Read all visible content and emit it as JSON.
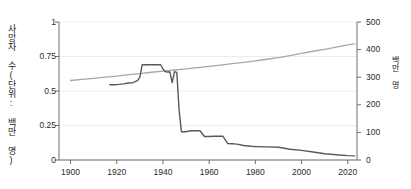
{
  "chart_data": {
    "type": "line",
    "title": "",
    "subtitle": "",
    "xlabel": "",
    "ylabel": "사망자 수(단위: 백만 명)",
    "ylabel_right": "백만 명",
    "xlim": [
      1895,
      2024
    ],
    "ylim": [
      0,
      1
    ],
    "ylim_right": [
      0,
      500
    ],
    "grid": true,
    "legend_position": "none",
    "xticks": [
      1900,
      1920,
      1940,
      1960,
      1980,
      2000,
      2020
    ],
    "xtick_labels": [
      "1900",
      "1920",
      "1940",
      "1960",
      "1980",
      "2000",
      "2020"
    ],
    "yticks_left": [
      0,
      0.25,
      0.5,
      0.75,
      1
    ],
    "ytick_labels_left": [
      "0",
      "0.25",
      "0.5",
      "0.75",
      "1"
    ],
    "yticks_right": [
      0,
      100,
      200,
      300,
      400,
      500
    ],
    "ytick_labels_right": [
      "0",
      "100",
      "200",
      "300",
      "400",
      "500"
    ],
    "colors": {
      "population_line": "#a7a7a7",
      "deaths_line": "#5a5a5a",
      "grid": "#ececec",
      "axis": "#6e6e6e",
      "background": "#ffffff"
    },
    "series": [
      {
        "name": "인구",
        "axis": "right",
        "color": "#a7a7a7",
        "x": [
          1900,
          1905,
          1910,
          1915,
          1920,
          1925,
          1930,
          1935,
          1940,
          1945,
          1950,
          1955,
          1960,
          1965,
          1970,
          1975,
          1980,
          1985,
          1990,
          1995,
          2000,
          2005,
          2010,
          2015,
          2020,
          2023
        ],
        "values": [
          288,
          292,
          296,
          300,
          304,
          309,
          313,
          318,
          322,
          326,
          330,
          335,
          339,
          344,
          349,
          354,
          359,
          365,
          371,
          378,
          386,
          394,
          401,
          409,
          417,
          421
        ]
      },
      {
        "name": "사망자 수",
        "axis": "left",
        "color": "#5a5a5a",
        "x": [
          1917,
          1919,
          1921,
          1923,
          1925,
          1927,
          1929,
          1930,
          1931,
          1933,
          1935,
          1937,
          1939,
          1940,
          1941,
          1942,
          1943,
          1944,
          1945,
          1946,
          1947,
          1948,
          1950,
          1952,
          1954,
          1956,
          1958,
          1960,
          1962,
          1964,
          1966,
          1968,
          1970,
          1972,
          1975,
          1978,
          1980,
          1985,
          1990,
          1995,
          2000,
          2005,
          2010,
          2015,
          2020,
          2023
        ],
        "values": [
          0.545,
          0.545,
          0.548,
          0.552,
          0.558,
          0.56,
          0.575,
          0.6,
          0.69,
          0.69,
          0.69,
          0.69,
          0.69,
          0.66,
          0.64,
          0.638,
          0.638,
          0.56,
          0.64,
          0.635,
          0.36,
          0.205,
          0.205,
          0.212,
          0.212,
          0.212,
          0.17,
          0.17,
          0.172,
          0.172,
          0.172,
          0.12,
          0.118,
          0.115,
          0.105,
          0.1,
          0.098,
          0.095,
          0.092,
          0.078,
          0.07,
          0.058,
          0.045,
          0.038,
          0.032,
          0.03
        ]
      }
    ]
  }
}
